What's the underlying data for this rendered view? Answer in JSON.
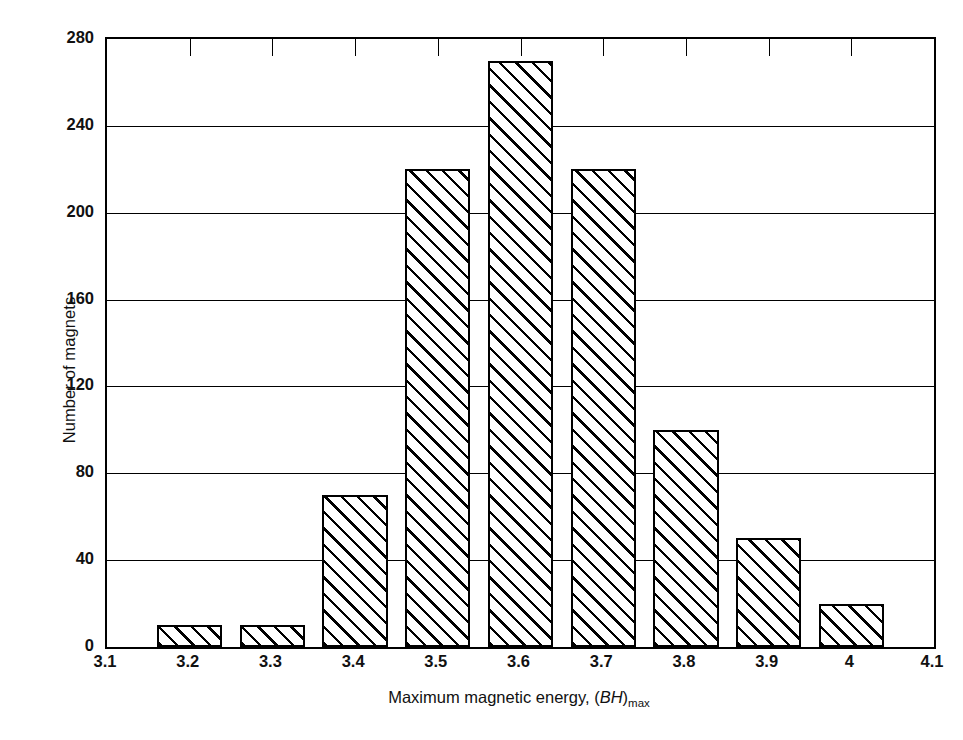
{
  "chart": {
    "type": "bar",
    "title": "",
    "y_axis_title": "Number of magnets",
    "x_axis_title_prefix": "Maximum magnetic energy, (",
    "x_axis_title_italic": "BH",
    "x_axis_title_close": ")",
    "x_axis_title_subscript": "max",
    "y_ticks": [
      "0",
      "40",
      "80",
      "120",
      "160",
      "200",
      "240",
      "280"
    ],
    "x_ticks": [
      "3.1",
      "3.2",
      "3.3",
      "3.4",
      "3.5",
      "3.6",
      "3.7",
      "3.8",
      "3.9",
      "4",
      "4.1"
    ],
    "ink_color": "#000000",
    "background_color": "#ffffff"
  },
  "chart_data": {
    "type": "bar",
    "title": "",
    "xlabel": "Maximum magnetic energy, (BH)max",
    "ylabel": "Number of magnets",
    "xlim": [
      3.1,
      4.1
    ],
    "ylim": [
      0,
      280
    ],
    "ytick_values": [
      0,
      40,
      80,
      120,
      160,
      200,
      240,
      280
    ],
    "xtick_values": [
      3.1,
      3.2,
      3.3,
      3.4,
      3.5,
      3.6,
      3.7,
      3.8,
      3.9,
      4.0,
      4.1
    ],
    "grid": "horizontal",
    "legend": "none",
    "bar_fill": "diagonal-hatch",
    "categories": [
      "3.2",
      "3.3",
      "3.4",
      "3.5",
      "3.6",
      "3.7",
      "3.8",
      "3.9",
      "4"
    ],
    "values": [
      10,
      10,
      70,
      220,
      270,
      220,
      100,
      50,
      20
    ],
    "bins": [
      {
        "center": 3.2,
        "value": 10
      },
      {
        "center": 3.3,
        "value": 10
      },
      {
        "center": 3.4,
        "value": 70
      },
      {
        "center": 3.5,
        "value": 220
      },
      {
        "center": 3.6,
        "value": 270
      },
      {
        "center": 3.7,
        "value": 220
      },
      {
        "center": 3.8,
        "value": 100
      },
      {
        "center": 3.9,
        "value": 50
      },
      {
        "center": 4.0,
        "value": 20
      }
    ]
  }
}
